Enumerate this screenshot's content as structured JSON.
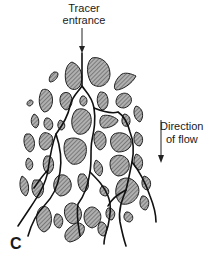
{
  "figure": {
    "panel_letter": "C",
    "labels": {
      "tracer_line1": "Tracer",
      "tracer_line2": "entrance",
      "flow_line1": "Direction",
      "flow_line2": "of flow"
    },
    "colors": {
      "grain_fill": "#9a9a9a",
      "grain_outline": "#222222",
      "channel": "#111111",
      "background": "#ffffff"
    },
    "elements": {
      "grains": "hatched irregular particles (porous medium)",
      "channels": "branching tracer flow paths",
      "arrows": [
        "tracer entrance arrow (down)",
        "direction of flow arrow (down)"
      ]
    }
  }
}
